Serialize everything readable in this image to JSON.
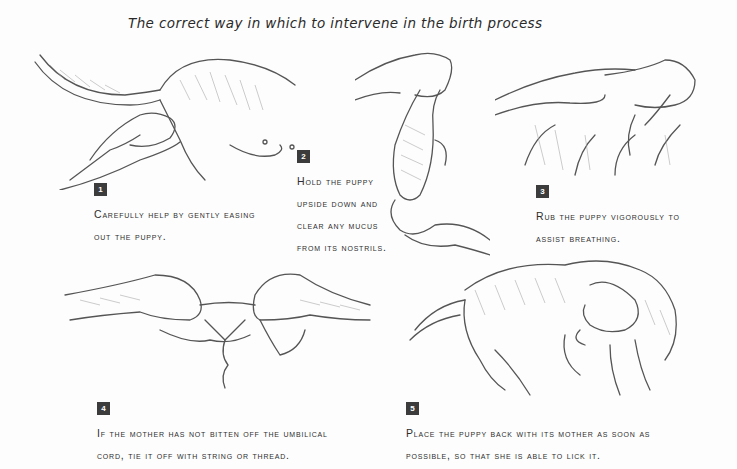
{
  "title": "The correct way in which to intervene in the birth process",
  "steps": [
    {
      "number": "1",
      "lines": [
        "Carefully help by gently easing",
        "out the puppy."
      ],
      "illustration": "hands-easing-puppy-from-mother"
    },
    {
      "number": "2",
      "lines": [
        "Hold the puppy",
        "upside down and",
        "clear any mucus",
        "from its nostrils."
      ],
      "illustration": "hands-holding-puppy-upside-down"
    },
    {
      "number": "3",
      "lines": [
        "Rub the puppy vigorously to",
        "assist breathing."
      ],
      "illustration": "hands-rubbing-puppy"
    },
    {
      "number": "4",
      "lines": [
        "If the mother has not bitten off the umbilical",
        "cord, tie it off with string or thread."
      ],
      "illustration": "hands-tying-umbilical-cord"
    },
    {
      "number": "5",
      "lines": [
        "Place the puppy back with its mother as soon as",
        "possible, so that she is able to lick it."
      ],
      "illustration": "mother-dog-licking-puppy"
    }
  ],
  "colors": {
    "badge": "#3c3c3c",
    "text": "#2e2e2e",
    "background": "#fdfdfd",
    "sketch": "#555555"
  }
}
